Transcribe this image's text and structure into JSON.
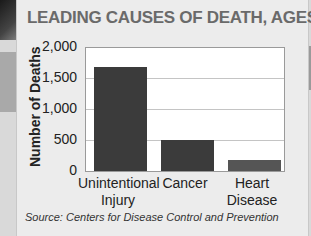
{
  "chart_data": {
    "type": "bar",
    "title": "LEADING CAUSES OF DEATH, AGES 10–14",
    "xlabel": "",
    "ylabel": "Number of Deaths",
    "categories": [
      "Unintentional Injury",
      "Cancer",
      "Heart Disease"
    ],
    "category_lines": [
      [
        "Unintentional",
        "Injury"
      ],
      [
        "Cancer",
        ""
      ],
      [
        "Heart",
        "Disease"
      ]
    ],
    "values": [
      1680,
      500,
      180
    ],
    "ylim": [
      0,
      2000
    ],
    "yticks": [
      "2,000",
      "1,500",
      "1,000",
      "500",
      "0"
    ],
    "grid": true,
    "legend": null,
    "source": "Source: Centers for Disease Control and Prevention"
  },
  "colors": {
    "bar": "#3b3b3b",
    "title": "#6a6a6a",
    "panel": "#ececec",
    "plot_bg": "#ffffff"
  }
}
